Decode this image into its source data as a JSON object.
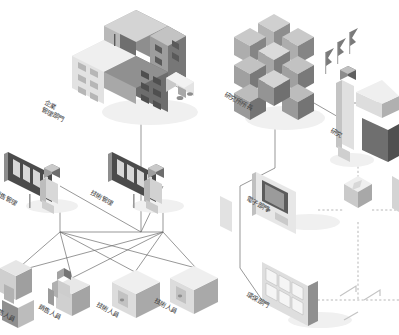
{
  "diagram": {
    "style": "isometric grayscale organizational network diagram",
    "background_color": "#ffffff",
    "line_color": "#6b6b6b",
    "dashed_line_color": "#9a9a9a",
    "label_color": "#3a3a3a",
    "palette": {
      "light": "#e8e8e8",
      "mid": "#bdbdbd",
      "dark": "#8a8a8a",
      "darker": "#6a6a6a",
      "shadow": "#efefef"
    }
  },
  "left_cluster": {
    "name": "企業組織",
    "nodes": [
      {
        "id": "hq",
        "label": "企業管理部門",
        "label_lines": [
          "企業",
          "管理部門"
        ],
        "icon": "office-building-icon",
        "x": 130,
        "y": 60,
        "level": 0
      },
      {
        "id": "sales_mgr",
        "label": "銷售管理",
        "label_lines": [
          "銷售管理"
        ],
        "icon": "person-with-board-icon",
        "x": 38,
        "y": 185,
        "level": 1
      },
      {
        "id": "tech_mgr",
        "label": "技術管理",
        "label_lines": [
          "技術管理"
        ],
        "icon": "person-with-board-icon",
        "x": 140,
        "y": 185,
        "level": 1
      },
      {
        "id": "staff_1",
        "label": "銷售人員",
        "label_lines": [
          "銷售人員"
        ],
        "icon": "desk-worker-icon",
        "x": 14,
        "y": 300,
        "level": 2
      },
      {
        "id": "staff_2",
        "label": "銷售人員",
        "label_lines": [
          "銷售人員"
        ],
        "icon": "desk-worker-icon",
        "x": 72,
        "y": 300,
        "level": 2
      },
      {
        "id": "staff_3",
        "label": "技術人員",
        "label_lines": [
          "技術人員"
        ],
        "icon": "computer-box-icon",
        "x": 128,
        "y": 300,
        "level": 2
      },
      {
        "id": "staff_4",
        "label": "技術人員",
        "label_lines": [
          "技術人員"
        ],
        "icon": "computer-box-icon",
        "x": 184,
        "y": 300,
        "level": 2
      }
    ],
    "links": [
      {
        "from": "hq",
        "to": "sales_mgr",
        "style": "solid"
      },
      {
        "from": "hq",
        "to": "tech_mgr",
        "style": "solid"
      },
      {
        "from": "sales_mgr",
        "to": "staff_1",
        "style": "solid"
      },
      {
        "from": "sales_mgr",
        "to": "staff_2",
        "style": "solid"
      },
      {
        "from": "sales_mgr",
        "to": "staff_3",
        "style": "solid"
      },
      {
        "from": "sales_mgr",
        "to": "staff_4",
        "style": "solid"
      },
      {
        "from": "tech_mgr",
        "to": "staff_1",
        "style": "solid"
      },
      {
        "from": "tech_mgr",
        "to": "staff_2",
        "style": "solid"
      },
      {
        "from": "tech_mgr",
        "to": "staff_3",
        "style": "solid"
      },
      {
        "from": "tech_mgr",
        "to": "staff_4",
        "style": "solid"
      }
    ]
  },
  "right_cluster": {
    "name": "研究所組織",
    "nodes": [
      {
        "id": "director",
        "label": "研究所所長",
        "label_lines": [
          "研究所所長"
        ],
        "icon": "cube-cluster-icon",
        "x": 272,
        "y": 62,
        "level": 0
      },
      {
        "id": "research",
        "label": "研究",
        "label_lines": [
          "研究"
        ],
        "icon": "researcher-icon",
        "x": 344,
        "y": 92,
        "level": 1
      },
      {
        "id": "electronic",
        "label": "電子部門",
        "label_lines": [
          "電子部門"
        ],
        "icon": "monitor-panel-icon",
        "x": 296,
        "y": 198,
        "level": 1
      },
      {
        "id": "environ",
        "label": "環保部門",
        "label_lines": [
          "環保部門"
        ],
        "icon": "grid-panel-icon",
        "x": 310,
        "y": 292,
        "level": 1
      }
    ],
    "links": [
      {
        "from": "director",
        "to": "research",
        "style": "solid"
      },
      {
        "from": "director",
        "to": "electronic",
        "style": "solid"
      },
      {
        "from": "director",
        "to": "environ",
        "style": "solid"
      },
      {
        "from": "research",
        "to": "node_hub",
        "style": "dashed"
      },
      {
        "from": "electronic",
        "to": "node_hub",
        "style": "dashed"
      },
      {
        "from": "environ",
        "to": "node_far",
        "style": "dashed"
      }
    ],
    "connector_nodes": [
      {
        "id": "node_hub",
        "icon": "diamond-node-icon",
        "x": 358,
        "y": 200
      },
      {
        "id": "node_far",
        "icon": "arrow-node-icon",
        "x": 360,
        "y": 300
      }
    ]
  },
  "icons": {
    "office_building": "office-building-icon",
    "truck": "truck-icon",
    "cube_cluster": "cube-cluster-icon",
    "flag": "flag-icon",
    "person": "person-icon",
    "display_board": "display-board-icon",
    "monitor": "monitor-icon",
    "grid_panel": "grid-panel-icon",
    "diamond_node": "diamond-node-icon"
  }
}
